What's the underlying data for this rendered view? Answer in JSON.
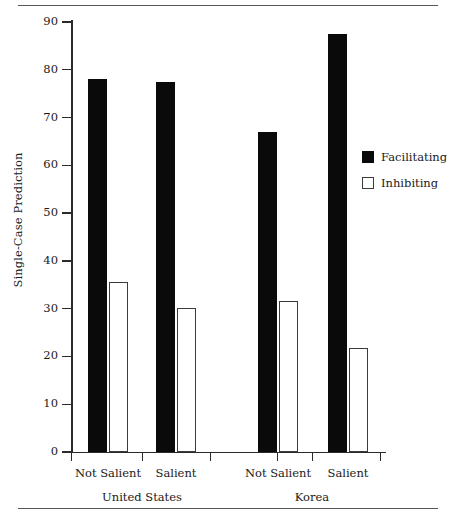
{
  "chart_data": {
    "type": "bar",
    "title": "",
    "xlabel": "",
    "ylabel": "Single-Case Prediction",
    "ylim": [
      0,
      90
    ],
    "yticks": [
      0,
      10,
      20,
      30,
      40,
      50,
      60,
      70,
      80,
      90
    ],
    "ytick_labels": [
      "0",
      "10",
      "20",
      "30",
      "40",
      "50",
      "60",
      "70",
      "80",
      "90"
    ],
    "grid": false,
    "legend_position": "right",
    "groups": [
      {
        "name": "United States",
        "categories": [
          "Not Salient",
          "Salient"
        ]
      },
      {
        "name": "Korea",
        "categories": [
          "Not Salient",
          "Salient"
        ]
      }
    ],
    "categories": [
      "United States / Not Salient",
      "United States / Salient",
      "Korea / Not Salient",
      "Korea / Salient"
    ],
    "series": [
      {
        "name": "Facilitating",
        "color": "#0a0a0a",
        "style": "filled",
        "values": [
          78.0,
          77.5,
          67.0,
          87.5
        ]
      },
      {
        "name": "Inhibiting",
        "color": "#ffffff",
        "style": "open",
        "values": [
          35.6,
          30.2,
          31.7,
          21.7
        ]
      }
    ]
  },
  "axis": {
    "y_title": "Single-Case Prediction",
    "ticks": [
      {
        "value": 90,
        "label": "90"
      },
      {
        "value": 80,
        "label": "80"
      },
      {
        "value": 70,
        "label": "70"
      },
      {
        "value": 60,
        "label": "60"
      },
      {
        "value": 50,
        "label": "50"
      },
      {
        "value": 40,
        "label": "40"
      },
      {
        "value": 30,
        "label": "30"
      },
      {
        "value": 20,
        "label": "20"
      },
      {
        "value": 10,
        "label": "10"
      },
      {
        "value": 0,
        "label": "0"
      }
    ]
  },
  "xlabels": {
    "us_not_salient": "Not Salient",
    "us_salient": "Salient",
    "korea_not_salient": "Not Salient",
    "korea_salient": "Salient",
    "group_us": "United States",
    "group_korea": "Korea"
  },
  "legend": {
    "items": [
      {
        "label": "Facilitating",
        "style": "filled",
        "color": "#0a0a0a"
      },
      {
        "label": "Inhibiting",
        "style": "open",
        "color": "#ffffff"
      }
    ]
  }
}
